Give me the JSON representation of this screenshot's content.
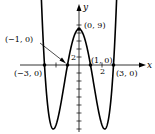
{
  "chart_data": {
    "type": "line",
    "title": "",
    "function": "y = x^4 - 10x^2 + 9",
    "xlabel": "x",
    "ylabel": "y",
    "xlim": [
      -3.4,
      3.4
    ],
    "ylim": [
      -16,
      12
    ],
    "x_ticks": [
      -3,
      -2,
      -1,
      0,
      1,
      2,
      3
    ],
    "x_tick_labels": [
      {
        "value": 2,
        "label": "2"
      }
    ],
    "y_tick_labels": [
      {
        "value": 2,
        "label": "2"
      }
    ],
    "points": [
      {
        "x": -3,
        "y": 0,
        "label": "(−3, 0)"
      },
      {
        "x": -1,
        "y": 0,
        "label": "(−1, 0)"
      },
      {
        "x": 0,
        "y": 9,
        "label": "(0, 9)"
      },
      {
        "x": 1,
        "y": 0,
        "label": "(1, 0)"
      },
      {
        "x": 3,
        "y": 0,
        "label": "(3, 0)"
      }
    ],
    "minima": [
      {
        "x": -2.236,
        "y": -16
      },
      {
        "x": 2.236,
        "y": -16
      }
    ],
    "grid": false
  },
  "labels": {
    "x_axis": "x",
    "y_axis": "y",
    "tick_x_2": "2",
    "tick_y_2": "2",
    "pt_m3": "(−3, 0)",
    "pt_m1": "(−1, 0)",
    "pt_0_9": "(0, 9)",
    "pt_1": "(1, 0)",
    "pt_3": "(3, 0)"
  }
}
